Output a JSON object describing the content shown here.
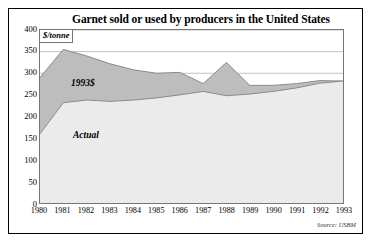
{
  "figure": {
    "title": "Garnet sold or used by producers in the United States",
    "unit_label": "$/tonne",
    "source": "Source: USBM"
  },
  "colors": {
    "constant_dollar_fill": "#bdbdbd",
    "actual_fill": "#ebebeb",
    "line": "#8a8a8a",
    "grid": "#9a9a9a",
    "frame": "#000000"
  },
  "labels": {
    "constant_dollar": "1993$",
    "actual": "Actual"
  },
  "chart_data": {
    "type": "area",
    "title": "Garnet sold or used by producers in the United States",
    "xlabel": "",
    "ylabel": "$/tonne",
    "ylim": [
      0,
      400
    ],
    "yticks": [
      0,
      50,
      100,
      150,
      200,
      250,
      300,
      350,
      400
    ],
    "ytick_labels": [
      "0",
      "50",
      "100",
      "150",
      "200",
      "250",
      "300",
      "350",
      "400"
    ],
    "grid": true,
    "legend": "inline-annotations",
    "categories": [
      1980,
      1981,
      1982,
      1983,
      1984,
      1985,
      1986,
      1987,
      1988,
      1989,
      1990,
      1991,
      1992,
      1993
    ],
    "xtick_labels": [
      "1980",
      "1981",
      "1982",
      "1983",
      "1984",
      "1985",
      "1986",
      "1987",
      "1988",
      "1989",
      "1990",
      "1991",
      "1992",
      "1993"
    ],
    "series": [
      {
        "name": "1993$",
        "fill": "#bdbdbd",
        "values": [
          290,
          355,
          340,
          322,
          308,
          300,
          302,
          276,
          325,
          272,
          272,
          276,
          283,
          282
        ]
      },
      {
        "name": "Actual",
        "fill": "#ebebeb",
        "values": [
          160,
          232,
          238,
          235,
          238,
          243,
          250,
          258,
          248,
          252,
          258,
          266,
          277,
          282
        ]
      }
    ]
  }
}
